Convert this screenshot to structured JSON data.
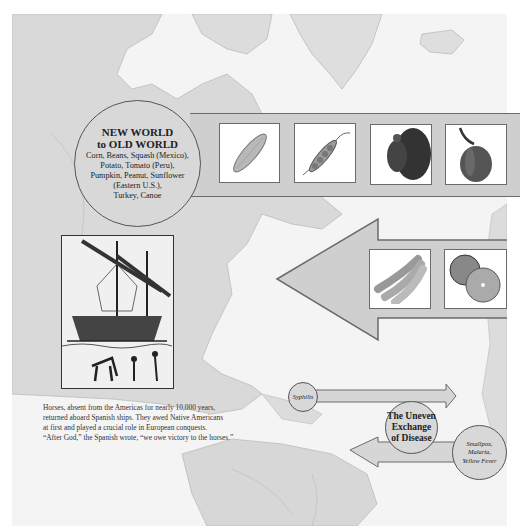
{
  "new_world_to_old_world": {
    "title_line1": "NEW WORLD",
    "title_line2": "to OLD WORLD",
    "items_line1": "Corn, Beans, Squash (Mexico),",
    "items_line2": "Potato, Tomato (Peru),",
    "items_line3": "Pumpkin, Peanut, Sunflower",
    "items_line4": "(Eastern U.S.),",
    "items_line5": "Turkey, Canoe",
    "images": [
      "corn-image",
      "pea-pod-image",
      "turkey-image",
      "pumpkin-image"
    ]
  },
  "old_world_to_new_world": {
    "images": [
      "bananas-image",
      "oranges-image"
    ]
  },
  "ship_caption": {
    "line1": "Horses, absent from the Americas for nearly 10,000 years,",
    "line2": "returned aboard Spanish ships. They awed Native Americans",
    "line3": "at first and played a crucial role in European conquests.",
    "line4": "“After God,” the Spanish wrote, “we owe victory to the horses.”"
  },
  "disease_exchange": {
    "title_line1": "The Uneven",
    "title_line2": "Exchange",
    "title_line3": "of Disease",
    "new_to_old": "Syphilis",
    "old_to_new_line1": "Smallpox,",
    "old_to_new_line2": "Malaria,",
    "old_to_new_line3": "Yellow Fever"
  },
  "colors": {
    "map_land": "#d9d9d9",
    "map_water": "#f4f4f4",
    "arrow_fill": "#cfcfcf",
    "outline": "#6b6b6b"
  }
}
